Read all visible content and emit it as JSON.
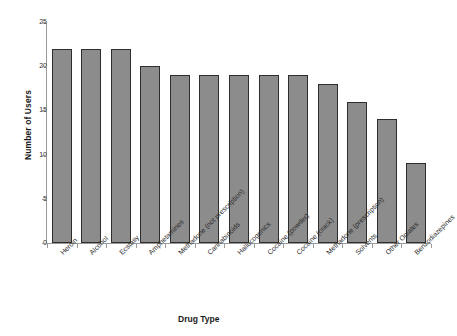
{
  "chart_data": {
    "type": "bar",
    "title": "",
    "xlabel": "Drug Type",
    "ylabel": "Number of Users",
    "categories": [
      "Heroin",
      "Alcohol",
      "Ecstasy",
      "Amphetamines",
      "Methadone (not prescription)",
      "Cannabinoids",
      "Hallucogenics",
      "Cocaine (powder)",
      "Cocaine (crack)",
      "Methadone (prescription)",
      "Solvents",
      "Other Opiates",
      "Benzodiazepines"
    ],
    "values": [
      22,
      22,
      22,
      20,
      19,
      19,
      19,
      19,
      19,
      18,
      16,
      14,
      9
    ],
    "ylim": [
      0,
      25
    ],
    "yticks": [
      0,
      5,
      10,
      15,
      20,
      25
    ],
    "ytick_labels": [
      "0",
      "5",
      "10",
      "15",
      "20",
      "25"
    ],
    "grid": false,
    "legend": "none",
    "bar_color": "#8c8c8c",
    "bar_border_color": "#2e2e2e",
    "axis_color": "#9a9a9a",
    "background": "#ffffff"
  }
}
